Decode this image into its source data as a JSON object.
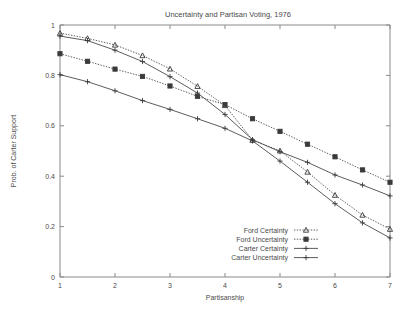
{
  "chart_data": {
    "type": "line",
    "title": "Uncertainty and Partisan Voting, 1976",
    "xlabel": "Partisanship",
    "ylabel": "Prob. of Carter Support",
    "xlim": [
      1,
      7
    ],
    "ylim": [
      0,
      1
    ],
    "xticks": [
      "1",
      "2",
      "3",
      "4",
      "5",
      "6",
      "7"
    ],
    "yticks": [
      "0",
      "0.2",
      "0.4",
      "0.6",
      "0.8",
      "1"
    ],
    "grid": false,
    "legend_position": "bottom-right",
    "x": [
      1,
      1.5,
      2,
      2.5,
      3,
      3.5,
      4,
      4.5,
      5,
      5.5,
      6,
      6.5,
      7
    ],
    "series": [
      {
        "name": "Ford Certainty",
        "marker": "triangle-open",
        "linestyle": "dotted",
        "values": [
          0.968,
          0.947,
          0.921,
          0.879,
          0.826,
          0.757,
          0.681,
          0.543,
          0.501,
          0.417,
          0.325,
          0.246,
          0.19
        ]
      },
      {
        "name": "Ford Uncertainty",
        "marker": "square-filled",
        "linestyle": "dotted",
        "values": [
          0.886,
          0.856,
          0.825,
          0.796,
          0.758,
          0.717,
          0.684,
          0.628,
          0.578,
          0.527,
          0.477,
          0.425,
          0.376
        ]
      },
      {
        "name": "Carter Certainty",
        "marker": "plus",
        "linestyle": "solid",
        "values": [
          0.803,
          0.775,
          0.739,
          0.7,
          0.665,
          0.628,
          0.59,
          0.54,
          0.46,
          0.376,
          0.291,
          0.215,
          0.155
        ]
      },
      {
        "name": "Carter Uncertainty",
        "marker": "plus",
        "linestyle": "solid",
        "values": [
          0.956,
          0.938,
          0.9,
          0.855,
          0.795,
          0.73,
          0.645,
          0.545,
          0.497,
          0.455,
          0.405,
          0.365,
          0.322
        ]
      }
    ]
  },
  "colors": {
    "line": "#4a4a4a",
    "axis": "#8a8a8a",
    "text": "#4a4a4a",
    "background": "#ffffff"
  }
}
